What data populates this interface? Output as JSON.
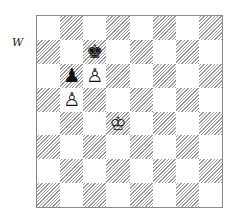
{
  "diagram": {
    "side_to_move_label": "W",
    "board": {
      "files": [
        "a",
        "b",
        "c",
        "d",
        "e",
        "f",
        "g",
        "h"
      ],
      "ranks": [
        8,
        7,
        6,
        5,
        4,
        3,
        2,
        1
      ],
      "top_left_square_color": "light",
      "light_color": "#ffffff",
      "dark_style": "gray diagonal hatching",
      "pieces": [
        {
          "square": "c7",
          "color": "black",
          "type": "king",
          "glyph": "♚"
        },
        {
          "square": "b6",
          "color": "black",
          "type": "pawn",
          "glyph": "♟"
        },
        {
          "square": "c6",
          "color": "white",
          "type": "pawn",
          "glyph": "♙"
        },
        {
          "square": "b5",
          "color": "white",
          "type": "pawn",
          "glyph": "♙"
        },
        {
          "square": "d4",
          "color": "white",
          "type": "king",
          "glyph": "♔"
        }
      ]
    }
  }
}
